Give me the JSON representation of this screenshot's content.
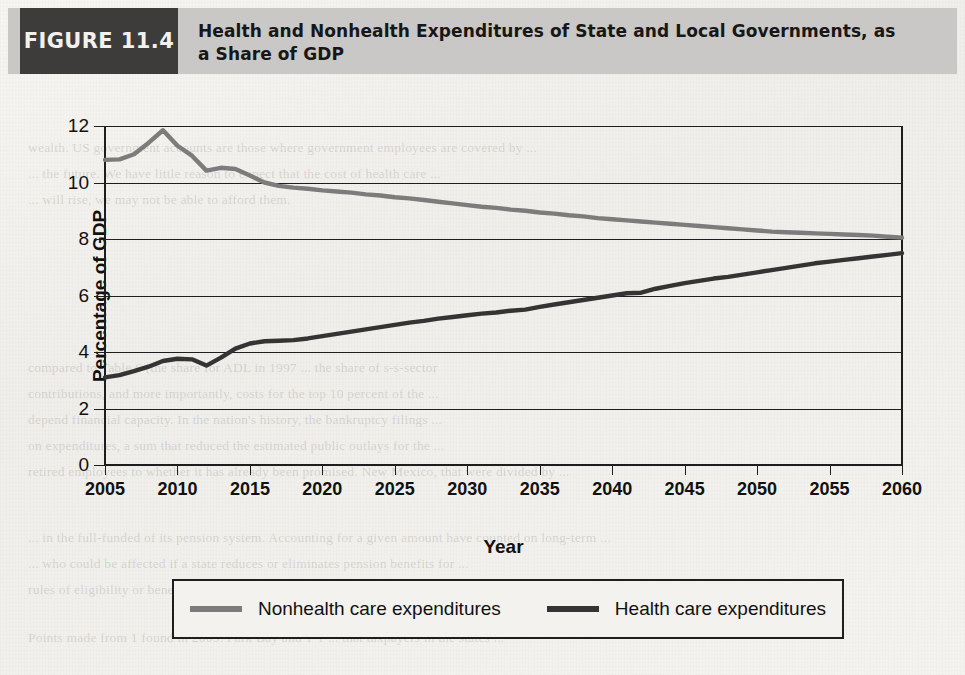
{
  "figure": {
    "badge": "FIGURE 11.4",
    "title": "Health and Nonhealth Expenditures of State and Local Governments, as a Share of GDP"
  },
  "colors": {
    "nonhealth": "#7c7c7c",
    "health": "#343434",
    "axis": "#1e1e1e",
    "header_bar": "#c9c8c6",
    "badge_bg": "#3d3c3b",
    "paper": "#f2f1ee"
  },
  "legend": {
    "items": [
      {
        "label": "Nonhealth care expenditures",
        "color": "#7c7c7c",
        "series": "nonhealth"
      },
      {
        "label": "Health care expenditures",
        "color": "#343434",
        "series": "health"
      }
    ]
  },
  "background_text": [
    "wealth. US government accounts are those where government employees are covered by ...",
    "... the future. We have little reason to expect that the cost of health care ...",
    "... will rise, we may not be able to afford them.",
    "compared to Table 6 (the share for ADL in 1997 ... the share of s-s-sector",
    "contributions, and more importantly, costs for the top 10 percent of the ...",
    "depend financial capacity. In the nation's history, the bankruptcy filings ...",
    "on expenditures, a sum that reduced the estimated public outlays for the ...",
    "retired employees to whether it has already been promised. New Mexico, that were divided by ...",
    "... in the full-funded of its pension system. Accounting for a given amount have counted on long-term ...",
    "... who could be affected if a state reduces or eliminates pension benefits for ...",
    "rules of eligibility or benefit terms, public pension plans are typically a government ...",
    "Points made from 1 found in 2009. Park Bay and 1-1 ... that taxpayers in the states ..."
  ],
  "chart_data": {
    "type": "line",
    "title": "Health and Nonhealth Expenditures of State and Local Governments, as a Share of GDP",
    "xlabel": "Year",
    "ylabel": "Percentage of GDP",
    "xlim": [
      2005,
      2060
    ],
    "ylim": [
      0,
      12
    ],
    "xticks": [
      2005,
      2010,
      2015,
      2020,
      2025,
      2030,
      2035,
      2040,
      2045,
      2050,
      2055,
      2060
    ],
    "yticks": [
      0,
      2,
      4,
      6,
      8,
      10,
      12
    ],
    "grid": "horizontal",
    "legend_position": "below",
    "x": [
      2005,
      2006,
      2007,
      2008,
      2009,
      2010,
      2011,
      2012,
      2013,
      2014,
      2015,
      2016,
      2017,
      2018,
      2019,
      2020,
      2021,
      2022,
      2023,
      2024,
      2025,
      2026,
      2027,
      2028,
      2029,
      2030,
      2031,
      2032,
      2033,
      2034,
      2035,
      2036,
      2037,
      2038,
      2039,
      2040,
      2041,
      2042,
      2043,
      2044,
      2045,
      2046,
      2047,
      2048,
      2049,
      2050,
      2051,
      2052,
      2053,
      2054,
      2055,
      2056,
      2057,
      2058,
      2059,
      2060
    ],
    "series": [
      {
        "name": "Nonhealth care expenditures",
        "color": "#7c7c7c",
        "values": [
          10.8,
          10.82,
          11.0,
          11.4,
          11.85,
          11.3,
          10.95,
          10.42,
          10.52,
          10.48,
          10.25,
          10.0,
          9.88,
          9.82,
          9.78,
          9.72,
          9.68,
          9.64,
          9.58,
          9.54,
          9.48,
          9.44,
          9.38,
          9.32,
          9.26,
          9.2,
          9.14,
          9.1,
          9.04,
          9.0,
          8.94,
          8.9,
          8.84,
          8.8,
          8.74,
          8.7,
          8.66,
          8.62,
          8.58,
          8.54,
          8.5,
          8.46,
          8.42,
          8.38,
          8.34,
          8.3,
          8.26,
          8.24,
          8.22,
          8.2,
          8.18,
          8.16,
          8.14,
          8.12,
          8.08,
          8.05
        ]
      },
      {
        "name": "Health care expenditures",
        "color": "#343434",
        "values": [
          3.1,
          3.18,
          3.32,
          3.48,
          3.68,
          3.76,
          3.74,
          3.52,
          3.8,
          4.12,
          4.3,
          4.38,
          4.4,
          4.42,
          4.48,
          4.56,
          4.64,
          4.72,
          4.8,
          4.88,
          4.96,
          5.04,
          5.1,
          5.18,
          5.24,
          5.3,
          5.36,
          5.4,
          5.46,
          5.5,
          5.6,
          5.68,
          5.76,
          5.84,
          5.92,
          6.0,
          6.08,
          6.1,
          6.24,
          6.34,
          6.44,
          6.52,
          6.6,
          6.66,
          6.74,
          6.82,
          6.9,
          6.98,
          7.06,
          7.14,
          7.2,
          7.26,
          7.32,
          7.38,
          7.44,
          7.5
        ]
      }
    ]
  }
}
